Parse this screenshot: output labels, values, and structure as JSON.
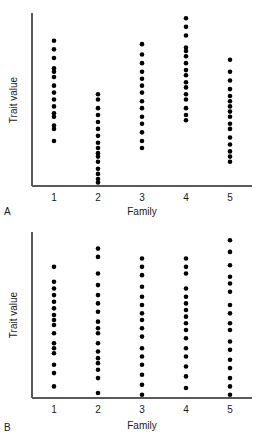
{
  "figure": {
    "background_color": "#ffffff",
    "dot_color": "#000000",
    "axis_color": "#5a5a5a"
  },
  "panels": [
    {
      "label": "A",
      "xlabel": "Family",
      "ylabel": "Trait value"
    },
    {
      "label": "B",
      "xlabel": "Family",
      "ylabel": "Trait value"
    }
  ],
  "chart_data": [
    {
      "type": "scatter",
      "title": "A",
      "subtitle": "",
      "xlabel": "Family",
      "ylabel": "Trait value",
      "xticklabels": [
        "1",
        "2",
        "3",
        "4",
        "5"
      ],
      "x": [
        1,
        2,
        3,
        4,
        5
      ],
      "yticklabels": [],
      "xlim": [
        0.5,
        5.5
      ],
      "ylim": [
        0,
        100
      ],
      "grid": false,
      "legend": null,
      "annotations": [
        "A"
      ],
      "note": "Strip/dot plot: trait values of individuals within five families. Between-family variance is large relative to within-family variance.",
      "series": [
        {
          "name": "Family 1",
          "x": 1,
          "values": [
            84,
            79,
            74,
            68,
            66,
            63,
            58,
            54,
            50,
            46,
            42,
            40,
            35,
            33,
            26
          ]
        },
        {
          "name": "Family 2",
          "x": 2,
          "values": [
            53,
            50,
            45,
            41,
            37,
            33,
            29,
            25,
            22,
            19,
            17,
            14,
            10,
            7,
            4,
            2
          ]
        },
        {
          "name": "Family 3",
          "x": 3,
          "values": [
            82,
            76,
            71,
            66,
            62,
            58,
            54,
            49,
            45,
            40,
            36,
            31,
            26,
            22
          ]
        },
        {
          "name": "Family 4",
          "x": 4,
          "values": [
            97,
            92,
            87,
            80,
            78,
            75,
            71,
            67,
            64,
            60,
            57,
            53,
            50,
            45,
            41,
            38
          ]
        },
        {
          "name": "Family 5",
          "x": 5,
          "values": [
            73,
            66,
            61,
            56,
            52,
            49,
            46,
            43,
            40,
            36,
            33,
            28,
            24,
            20,
            17,
            14
          ]
        }
      ]
    },
    {
      "type": "scatter",
      "title": "B",
      "subtitle": "",
      "xlabel": "Family",
      "ylabel": "Trait value",
      "xticklabels": [
        "1",
        "2",
        "3",
        "4",
        "5"
      ],
      "x": [
        1,
        2,
        3,
        4,
        5
      ],
      "yticklabels": [],
      "xlim": [
        0.5,
        5.5
      ],
      "ylim": [
        0,
        100
      ],
      "grid": false,
      "legend": null,
      "annotations": [
        "B"
      ],
      "note": "Strip/dot plot: trait values of individuals within five families. Within-family variance is large and families overlap strongly.",
      "series": [
        {
          "name": "Family 1",
          "x": 1,
          "values": [
            79,
            70,
            66,
            62,
            58,
            54,
            50,
            47,
            44,
            39,
            33,
            30,
            27,
            20,
            15,
            7
          ]
        },
        {
          "name": "Family 2",
          "x": 2,
          "values": [
            90,
            85,
            75,
            68,
            62,
            57,
            52,
            46,
            42,
            39,
            33,
            28,
            24,
            21,
            17,
            12,
            3
          ]
        },
        {
          "name": "Family 3",
          "x": 3,
          "values": [
            84,
            79,
            74,
            67,
            61,
            56,
            51,
            47,
            42,
            37,
            30,
            25,
            20,
            14,
            8,
            2
          ]
        },
        {
          "name": "Family 4",
          "x": 4,
          "values": [
            84,
            79,
            75,
            66,
            61,
            57,
            53,
            49,
            45,
            41,
            36,
            30,
            25,
            19,
            13,
            6
          ]
        },
        {
          "name": "Family 5",
          "x": 5,
          "values": [
            95,
            88,
            80,
            73,
            69,
            64,
            56,
            51,
            45,
            41,
            34,
            29,
            23,
            18,
            12,
            7,
            2
          ]
        }
      ]
    }
  ]
}
